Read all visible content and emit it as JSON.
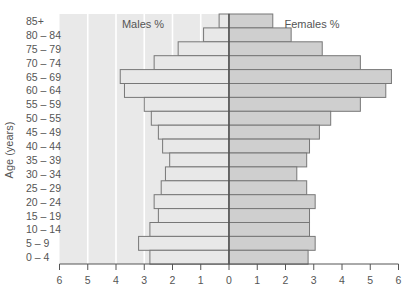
{
  "chart_data": {
    "type": "bar",
    "subtype": "population-pyramid",
    "title": "",
    "ylabel": "Age (years)",
    "xlabel": "",
    "categories": [
      "85+",
      "80 – 84",
      "75 – 79",
      "70 – 74",
      "65 – 69",
      "60 – 64",
      "55 – 59",
      "50 – 55",
      "45 – 49",
      "40 – 44",
      "35 – 39",
      "30 – 34",
      "25 – 29",
      "20 – 24",
      "15 – 19",
      "10 – 14",
      "5 – 9",
      "0 – 4"
    ],
    "series": [
      {
        "name": "Males %",
        "side": "left",
        "color": "#e8e8e8",
        "values": [
          0.35,
          0.9,
          1.8,
          2.65,
          3.85,
          3.7,
          3.0,
          2.75,
          2.5,
          2.35,
          2.1,
          2.25,
          2.4,
          2.65,
          2.5,
          2.8,
          3.2,
          2.8
        ]
      },
      {
        "name": "Females %",
        "side": "right",
        "color": "#cfcfcf",
        "values": [
          1.55,
          2.2,
          3.3,
          4.65,
          5.75,
          5.55,
          4.65,
          3.6,
          3.2,
          2.85,
          2.75,
          2.4,
          2.75,
          3.05,
          2.85,
          2.85,
          3.05,
          2.8
        ]
      }
    ],
    "x_ticks_left": [
      "6",
      "5",
      "4",
      "3",
      "2",
      "1"
    ],
    "x_ticks_right": [
      "0",
      "1",
      "2",
      "3",
      "4",
      "5",
      "6"
    ],
    "xlim": [
      -6,
      6
    ],
    "legend": {
      "left_label": "Males %",
      "right_label": "Females %",
      "position": "top-inside"
    },
    "grid": {
      "left_panel_vertical_lines": true,
      "right_panel": false
    }
  },
  "colors": {
    "left_panel_bg": "#e9e9e9",
    "gridline": "#ffffff",
    "bar_stroke": "#777777",
    "axis": "#555555",
    "text": "#555555"
  }
}
